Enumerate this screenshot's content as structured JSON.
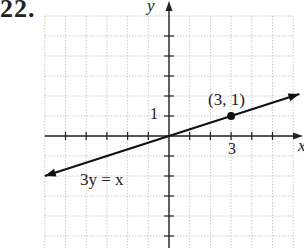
{
  "problem_number": "22.",
  "chart_data": {
    "type": "line",
    "title": "",
    "xlabel": "x",
    "ylabel": "y",
    "xlim": [
      -6,
      6
    ],
    "ylim": [
      -5,
      6
    ],
    "grid": true,
    "tick_labels": {
      "x": [
        "3"
      ],
      "y": [
        "1"
      ]
    },
    "series": [
      {
        "name": "3y = x",
        "equation": "3y = x",
        "x": [
          -6,
          6.3
        ],
        "y": [
          -2,
          2.1
        ]
      }
    ],
    "points": [
      {
        "x": 3,
        "y": 1,
        "label": "(3, 1)"
      }
    ],
    "annotations": [
      "(3, 1)",
      "3y = x"
    ]
  },
  "labels": {
    "y_axis": "y",
    "x_axis": "x",
    "point": "(3, 1)",
    "y_tick": "1",
    "x_tick": "3",
    "equation": "3y = x"
  }
}
